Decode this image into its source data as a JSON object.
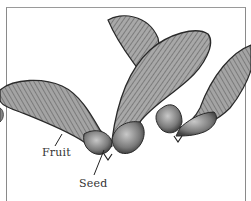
{
  "figure": {
    "labels": {
      "fruit": "Fruit",
      "seed": "Seed"
    },
    "colors": {
      "ink": "#2a2a2a",
      "wing_fill": "#9a9a9a",
      "seed_fill": "#7a7a7a",
      "frame": "#8a8a8a",
      "background": "#ffffff"
    }
  }
}
